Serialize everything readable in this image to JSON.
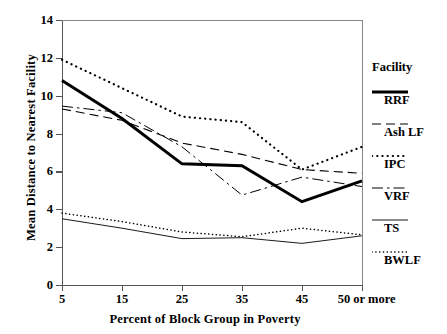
{
  "chart_data": {
    "type": "line",
    "title": "",
    "xlabel": "Percent of Block Group in Poverty",
    "ylabel": "Mean Distance to Nearest Facility",
    "categories": [
      "5",
      "15",
      "25",
      "35",
      "45",
      "50 or more"
    ],
    "x_tick_labels": [
      "5",
      "15",
      "25",
      "35",
      "45",
      "50 or more"
    ],
    "y_tick_labels": [
      "0",
      "2",
      "4",
      "6",
      "8",
      "10",
      "12",
      "14"
    ],
    "ylim": [
      0,
      14
    ],
    "ytick_step": 2,
    "grid": false,
    "legend_position": "right",
    "legend_title": "Facility",
    "series": [
      {
        "name": "RRF",
        "style": "solid-thick",
        "color": "#000000",
        "values": [
          10.8,
          8.8,
          6.4,
          6.3,
          4.4,
          5.5
        ]
      },
      {
        "name": "Ash LF",
        "style": "dashed",
        "color": "#000000",
        "values": [
          9.3,
          8.7,
          7.5,
          6.9,
          6.1,
          5.9
        ]
      },
      {
        "name": "IPC",
        "style": "dotted-bold",
        "color": "#000000",
        "values": [
          11.9,
          10.4,
          8.9,
          8.6,
          6.1,
          7.3
        ]
      },
      {
        "name": "VRF",
        "style": "dash-dot",
        "color": "#000000",
        "values": [
          9.45,
          9.1,
          7.3,
          4.75,
          5.7,
          5.2
        ]
      },
      {
        "name": "TS",
        "style": "solid-thin",
        "color": "#000000",
        "values": [
          3.5,
          3.0,
          2.45,
          2.5,
          2.2,
          2.6
        ]
      },
      {
        "name": "BWLF",
        "style": "dotted-fine",
        "color": "#000000",
        "values": [
          3.8,
          3.35,
          2.8,
          2.55,
          3.0,
          2.65
        ]
      }
    ]
  },
  "legend": {
    "header": "Facility",
    "entries": [
      {
        "label": "RRF"
      },
      {
        "label": "Ash LF"
      },
      {
        "label": "IPC"
      },
      {
        "label": "VRF"
      },
      {
        "label": "TS"
      },
      {
        "label": "BWLF"
      }
    ]
  },
  "axes": {
    "y_title": "Mean Distance to Nearest Facility",
    "x_title": "Percent of Block Group in Poverty"
  }
}
